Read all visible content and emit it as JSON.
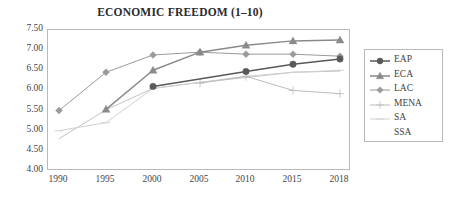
{
  "chart_data": {
    "type": "line",
    "title": "ECONOMIC FREEDOM (1–10)",
    "xlabel": "",
    "ylabel": "",
    "x": [
      1990,
      1995,
      2000,
      2005,
      2010,
      2015,
      2018
    ],
    "categories": [
      "1990",
      "1995",
      "2000",
      "2005",
      "2010",
      "2015",
      "2018"
    ],
    "xlim": [
      1990,
      2018
    ],
    "ylim": [
      4.0,
      7.5
    ],
    "yticks": [
      "4.00",
      "4.50",
      "5.00",
      "5.50",
      "6.00",
      "6.50",
      "7.00",
      "7.50"
    ],
    "ytick_values": [
      4.0,
      4.5,
      5.0,
      5.5,
      6.0,
      6.5,
      7.0,
      7.5
    ],
    "grid": false,
    "legend_position": "right",
    "series": [
      {
        "name": "EAP",
        "marker": "circle",
        "color": "#595959",
        "values": [
          null,
          null,
          6.1,
          null,
          6.47,
          6.65,
          6.78
        ]
      },
      {
        "name": "ECA",
        "marker": "triangle",
        "color": "#8a8a8a",
        "values": [
          null,
          5.53,
          6.5,
          6.95,
          7.12,
          7.23,
          7.25
        ]
      },
      {
        "name": "LAC",
        "marker": "diamond",
        "color": "#9a9a9a",
        "values": [
          5.5,
          6.45,
          6.88,
          6.95,
          6.9,
          6.9,
          6.85
        ]
      },
      {
        "name": "MENA",
        "marker": "cross",
        "color": "#bdbdbd",
        "values": [
          null,
          null,
          null,
          6.18,
          6.35,
          6.0,
          5.92
        ]
      },
      {
        "name": "SA",
        "marker": "line",
        "color": "#d0d0d0",
        "values": [
          5.0,
          5.2,
          6.05,
          6.2,
          6.35,
          6.45,
          6.5
        ]
      },
      {
        "name": "SSA",
        "marker": "none",
        "color": "#c4c4c4",
        "values": [
          4.8,
          5.52,
          6.05,
          6.2,
          6.32,
          6.45,
          6.48
        ]
      }
    ]
  },
  "legend": {
    "items": [
      {
        "label": "EAP"
      },
      {
        "label": "ECA"
      },
      {
        "label": "LAC"
      },
      {
        "label": "MENA"
      },
      {
        "label": "SA"
      },
      {
        "label": "SSA"
      }
    ]
  },
  "colors": {
    "axis": "#b9b9b9",
    "text": "#454545",
    "title": "#2b2b2b",
    "background": "#ffffff"
  }
}
